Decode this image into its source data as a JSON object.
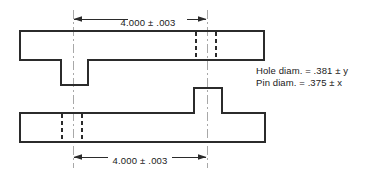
{
  "drawing": {
    "title": "Pin and hole clearance tolerance drawing",
    "canvas": {
      "width": 376,
      "height": 177,
      "background": "#ffffff"
    },
    "colors": {
      "outline": "#2b2b2b",
      "hidden_edge": "#2b2b2b",
      "centerline": "#a8a8a8",
      "dimension": "#2b2b2b",
      "text": "#1a1a1a",
      "background": "#ffffff"
    },
    "dimensions": [
      {
        "id": "top-dimension",
        "label": "4.000 ± .003",
        "nominal": "4.000",
        "tolerance": "± .003",
        "position": "top",
        "from_x": 73,
        "to_x": 207,
        "line_y": 19
      },
      {
        "id": "bottom-dimension",
        "label": "4.000 ± .003",
        "nominal": "4.000",
        "tolerance": "± .003",
        "position": "bottom",
        "from_x": 73,
        "to_x": 207,
        "line_y": 157
      }
    ],
    "notes": {
      "hole_note": "Hole diam.  =  .381 ± y",
      "pin_note": "Pin diam.  =  .375 ± x"
    },
    "parts": [
      {
        "id": "upper-plate",
        "name": "Upper plate",
        "x": 20,
        "y": 31,
        "width": 244,
        "height": 29,
        "feature": "hole",
        "feature_side": "right"
      },
      {
        "id": "upper-plate-pin",
        "name": "Upper plate pin",
        "x": 61,
        "y": 60,
        "width": 27,
        "height": 25,
        "direction": "down"
      },
      {
        "id": "lower-plate",
        "name": "Lower plate",
        "x": 20,
        "y": 113,
        "width": 245,
        "height": 29,
        "feature": "hole",
        "feature_side": "left"
      },
      {
        "id": "lower-plate-pin",
        "name": "Lower plate pin",
        "x": 194,
        "y": 88,
        "width": 28,
        "height": 25,
        "direction": "up"
      }
    ],
    "centerlines": [
      {
        "id": "left-centerline",
        "x": 73,
        "y1": 10,
        "y2": 168
      },
      {
        "id": "right-centerline",
        "x": 207,
        "y1": 10,
        "y2": 168
      }
    ],
    "hidden_edges": [
      {
        "id": "upper-hole-left",
        "x": 196,
        "y1": 32,
        "y2": 59
      },
      {
        "id": "upper-hole-right",
        "x": 216,
        "y1": 32,
        "y2": 59
      },
      {
        "id": "lower-hole-left",
        "x": 62,
        "y1": 114,
        "y2": 141
      },
      {
        "id": "lower-hole-right",
        "x": 82,
        "y1": 114,
        "y2": 141
      }
    ]
  }
}
